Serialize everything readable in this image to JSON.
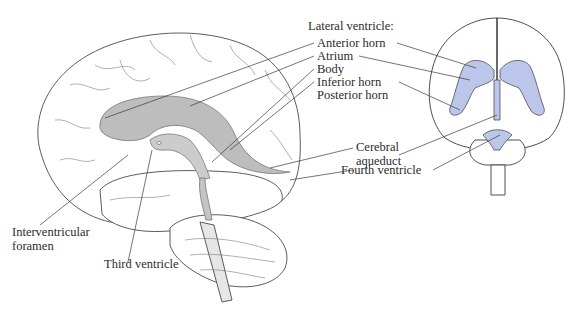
{
  "figure": {
    "views": [
      "lateral (sagittal) view",
      "frontal view"
    ],
    "colors": {
      "ventricle_fill_lateral": "#b9b9b9",
      "ventricle_fill_frontal": "#bcc6ea",
      "outline": "#3a3a3a",
      "text": "#2b2b2b"
    }
  },
  "labels": {
    "lateral_ventricle": "Lateral ventricle:",
    "anterior_horn": "Anterior horn",
    "atrium": "Atrium",
    "body": "Body",
    "inferior_horn": "Inferior horn",
    "posterior_horn": "Posterior horn",
    "cerebral_aqueduct_line1": "Cerebral",
    "cerebral_aqueduct_line2": "aqueduct",
    "fourth_ventricle": "Fourth ventricle",
    "interventricular_line1": "Interventricular",
    "interventricular_line2": "foramen",
    "third_ventricle": "Third ventricle"
  }
}
